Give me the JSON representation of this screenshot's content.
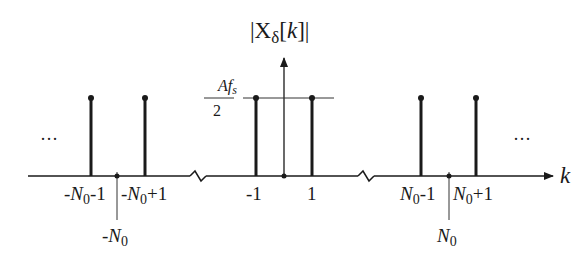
{
  "diagram": {
    "title": "|Xδ[k]|",
    "title_parts": {
      "open": "|X",
      "sub": "δ",
      "bracket": "[",
      "var": "k",
      "close": "]|"
    },
    "x_axis_label": "k",
    "amplitude_label": {
      "numerator": "Af",
      "numerator_sub": "s",
      "denominator": "2"
    },
    "ellipsis_left": "···",
    "ellipsis_right": "···",
    "stems": [
      {
        "k": "-N0-1",
        "label_main": "-N",
        "label_sub": "0",
        "label_tail": "-1"
      },
      {
        "k": "-N0+1",
        "label_main": "-N",
        "label_sub": "0",
        "label_tail": "+1"
      },
      {
        "k": "-1",
        "label_main": "-1",
        "label_sub": "",
        "label_tail": ""
      },
      {
        "k": "1",
        "label_main": "1",
        "label_sub": "",
        "label_tail": ""
      },
      {
        "k": "N0-1",
        "label_main": "N",
        "label_sub": "0",
        "label_tail": "-1"
      },
      {
        "k": "N0+1",
        "label_main": "N",
        "label_sub": "0",
        "label_tail": "+1"
      }
    ],
    "markers": [
      {
        "k": "-N0",
        "label_main": "-N",
        "label_sub": "0"
      },
      {
        "k": "N0",
        "label_main": "N",
        "label_sub": "0"
      }
    ],
    "axis_breaks": 2,
    "colors": {
      "ink": "#1a1a1a",
      "thin": "#333333",
      "background": "#ffffff"
    }
  }
}
